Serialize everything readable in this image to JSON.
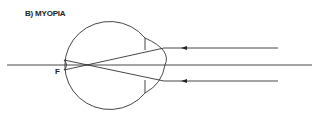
{
  "diagram": {
    "title": "B) MYOPIA",
    "focal_point_label": "F",
    "colors": {
      "stroke": "#333333",
      "background": "#ffffff"
    },
    "elements": [
      "eyeball",
      "cornea",
      "lens",
      "optical-axis",
      "incoming-parallel-rays",
      "converging-rays",
      "focal-point"
    ],
    "ray_count": 2
  }
}
